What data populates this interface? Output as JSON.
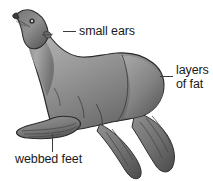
{
  "figure": {
    "background_color": "#ffffff",
    "body_fill_light": "#b4b4b4",
    "body_fill_mid": "#8d8d8d",
    "body_fill_dark": "#5e5e5e",
    "outline_color": "#2b2b2b",
    "label_color": "#1a1a1a",
    "leader_color": "#3c3c3c"
  },
  "callouts": [
    {
      "id": "small-ears",
      "label": "small ears",
      "lines": [
        "small ears"
      ],
      "leader": "horizontal-dash",
      "points_to": "ear"
    },
    {
      "id": "layers-of-fat",
      "label": "layers of fat",
      "lines": [
        "layers",
        "of fat"
      ],
      "leader": "horizontal-dash",
      "points_to": "rump"
    },
    {
      "id": "webbed-feet",
      "label": "webbed feet",
      "lines": [
        "webbed feet"
      ],
      "leader": "vertical-line",
      "points_to": "front-flipper"
    }
  ]
}
